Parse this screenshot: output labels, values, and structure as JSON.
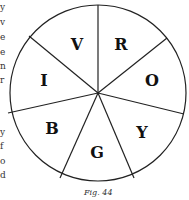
{
  "diagram": {
    "sectors": [
      {
        "label": "V",
        "x": 77,
        "y": 48
      },
      {
        "label": "R",
        "x": 121,
        "y": 48
      },
      {
        "label": "O",
        "x": 152,
        "y": 85
      },
      {
        "label": "Y",
        "x": 142,
        "y": 136
      },
      {
        "label": "G",
        "x": 97,
        "y": 156
      },
      {
        "label": "B",
        "x": 52,
        "y": 133
      },
      {
        "label": "I",
        "x": 44,
        "y": 85
      }
    ],
    "caption": "Fig. 44"
  },
  "left_fragments": [
    {
      "text": "y",
      "y": 3
    },
    {
      "text": "v",
      "y": 18
    },
    {
      "text": "e",
      "y": 33
    },
    {
      "text": "e",
      "y": 48
    },
    {
      "text": "n",
      "y": 62
    },
    {
      "text": "r",
      "y": 76
    },
    {
      "text": "y",
      "y": 128
    },
    {
      "text": "f",
      "y": 142
    },
    {
      "text": "o",
      "y": 157
    },
    {
      "text": "d",
      "y": 171
    }
  ]
}
